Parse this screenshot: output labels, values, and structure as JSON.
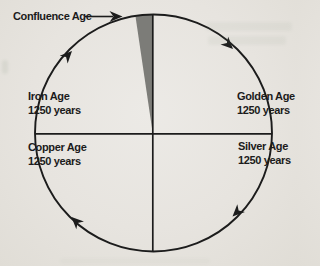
{
  "diagram": {
    "type": "cycle-of-ages-diagram",
    "confluence": {
      "label": "Confluence Age"
    },
    "ages": [
      {
        "name": "Iron Age",
        "duration": "1250 years",
        "position": "upper-left"
      },
      {
        "name": "Golden Age",
        "duration": "1250 years",
        "position": "upper-right"
      },
      {
        "name": "Copper Age",
        "duration": "1250 years",
        "position": "lower-left"
      },
      {
        "name": "Silver Age",
        "duration": "1250 years",
        "position": "lower-right"
      }
    ],
    "rotation_direction": "clockwise",
    "colors": {
      "background": "#e7e4df",
      "line": "#1c1c1c",
      "wedge": "#7c7c78",
      "text": "#1b1b1b"
    }
  }
}
